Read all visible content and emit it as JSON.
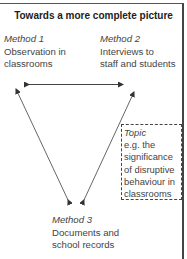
{
  "diagram": {
    "title": "Towards a more complete picture",
    "method1": {
      "label": "Method 1",
      "text_line1": "Observation in",
      "text_line2": "classrooms"
    },
    "method2": {
      "label": "Method 2",
      "text_line1": "Interviews to",
      "text_line2": "staff and students"
    },
    "method3": {
      "label": "Method 3",
      "text_line1": "Documents and",
      "text_line2": "school records"
    },
    "topic": {
      "label": "Topic",
      "lines": [
        "e.g. the",
        "significance",
        "of disruptive",
        "behaviour in",
        "classrooms"
      ]
    },
    "arrows": [
      {
        "from": "method1",
        "to": "method2",
        "type": "bidirectional"
      },
      {
        "from": "method3",
        "to": "method1",
        "type": "bidirectional"
      },
      {
        "from": "method3",
        "to": "method2",
        "type": "bidirectional"
      }
    ],
    "colors": {
      "line": "#444444",
      "text": "#444444",
      "title": "#222222"
    }
  }
}
